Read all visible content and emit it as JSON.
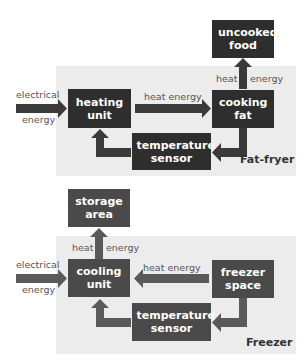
{
  "fat_fryer": {
    "title": "Fat-fryer",
    "boxes": {
      "output": "uncooked food",
      "unit": "heating unit",
      "medium": "cooking fat",
      "sensor": "temperature sensor"
    },
    "labels": {
      "input_line1": "electrical",
      "input_line2": "energy",
      "transfer": "heat energy",
      "out_heat": "heat",
      "out_energy": "energy"
    },
    "colors": {
      "box": "#2e2e2e",
      "arrow": "#3a3a3a",
      "panel": "#ececec"
    }
  },
  "freezer": {
    "title": "Freezer",
    "boxes": {
      "output": "storage area",
      "unit": "cooling unit",
      "medium": "freezer space",
      "sensor": "temperature sensor"
    },
    "labels": {
      "input_line1": "electrical",
      "input_line2": "energy",
      "transfer": "heat energy",
      "out_heat": "heat",
      "out_energy": "energy"
    },
    "colors": {
      "box": "#4a4a4a",
      "arrow": "#5a5a5a",
      "panel": "#ececec"
    }
  }
}
